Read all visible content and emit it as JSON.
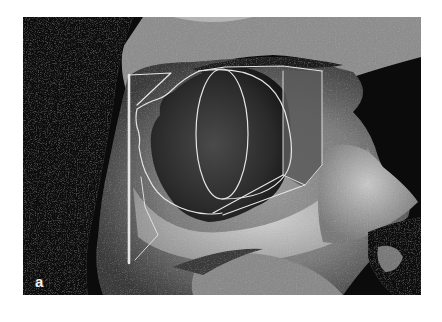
{
  "figure": {
    "panel_label": "a",
    "colors": {
      "background": "#ffffff",
      "photo_dark": "#0b0b0b",
      "bone_light": "#b8b8b8",
      "overlay_line": "#e6e6e6",
      "box_fill": "#555555",
      "label": "#f2f2f2"
    },
    "overlay_shapes": [
      "vertical-bar",
      "top-bracket",
      "orbit-outline",
      "ellipse",
      "d-arc",
      "right-box",
      "lower-diagonals",
      "lower-zigzag"
    ]
  }
}
